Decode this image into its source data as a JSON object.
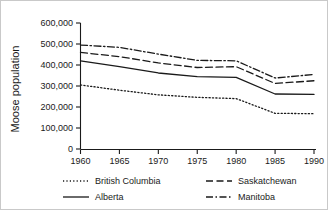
{
  "chart_data": {
    "type": "line",
    "title": "",
    "xlabel": "",
    "ylabel": "Moose population",
    "x": [
      1960,
      1965,
      1970,
      1975,
      1980,
      1985,
      1990
    ],
    "xlim": [
      1960,
      1990
    ],
    "ylim": [
      0,
      600000
    ],
    "grid": false,
    "legend_position": "bottom",
    "xticks": [
      "1960",
      "1965",
      "1970",
      "1975",
      "1980",
      "1985",
      "1990"
    ],
    "yticks": [
      "0",
      "100,000",
      "200,000",
      "300,000",
      "400,000",
      "500,000",
      "600,000"
    ],
    "ytick_values": [
      0,
      100000,
      200000,
      300000,
      400000,
      500000,
      600000
    ],
    "series": [
      {
        "name": "British Columbia",
        "style": "dotted",
        "values": [
          305000,
          280000,
          258000,
          246000,
          240000,
          170000,
          168000
        ]
      },
      {
        "name": "Alberta",
        "style": "solid",
        "values": [
          420000,
          392000,
          362000,
          345000,
          341000,
          262000,
          260000
        ]
      },
      {
        "name": "Saskatchewan",
        "style": "dashed",
        "values": [
          460000,
          440000,
          410000,
          388000,
          392000,
          312000,
          325000
        ]
      },
      {
        "name": "Manitoba",
        "style": "dashdot",
        "values": [
          495000,
          484000,
          452000,
          422000,
          420000,
          338000,
          355000
        ]
      }
    ]
  },
  "legend": {
    "entries": [
      {
        "label": "British Columbia",
        "style": "dotted"
      },
      {
        "label": "Saskatchewan",
        "style": "dashed"
      },
      {
        "label": "Alberta",
        "style": "solid"
      },
      {
        "label": "Manitoba",
        "style": "dashdot"
      }
    ]
  }
}
